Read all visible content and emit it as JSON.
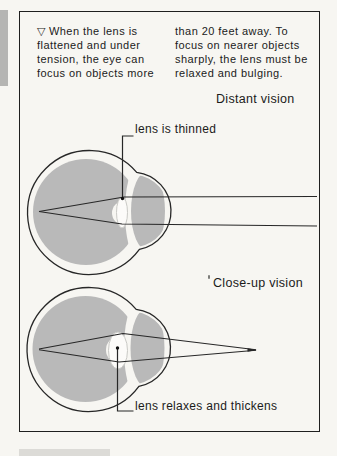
{
  "colors": {
    "paper": "#f7f6f2",
    "ink": "#1b1b1b",
    "frame_border": "#1f1f1f",
    "line": "#272727",
    "eye_gray": "#b9b9b9",
    "lens_fill": "#fcfbf9",
    "lens_edge": "#c9c9c5",
    "side_bar_gray": "#b5b5b3",
    "bottom_bar_gray": "#dcdbd7"
  },
  "caption": {
    "col1_lines": [
      "▽ When the lens is",
      "flattened and under",
      "tension, the eye can",
      "focus on objects more"
    ],
    "col2_lines": [
      "than 20 feet away. To",
      "focus on nearer objects",
      "sharply, the lens must be",
      "relaxed and bulging."
    ]
  },
  "diagram": {
    "distant": {
      "title": "Distant vision",
      "lens_label": "lens is thinned"
    },
    "closeup": {
      "title": "Close-up vision",
      "lens_label": "lens relaxes and thickens"
    }
  }
}
